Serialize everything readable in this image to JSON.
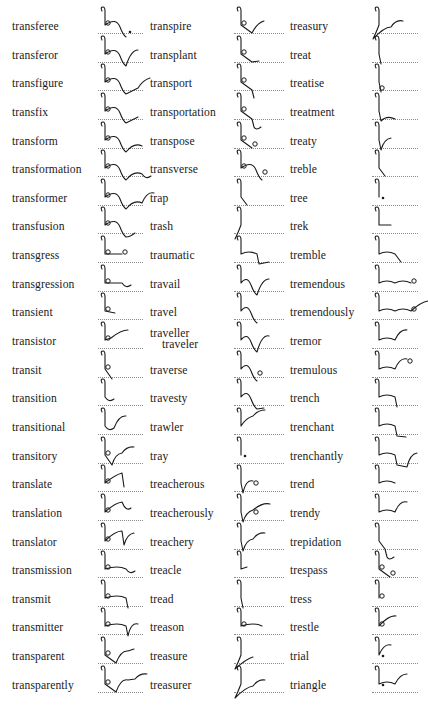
{
  "page": {
    "type": "shorthand-dictionary-page",
    "columns": [
      {
        "entries": [
          {
            "word": "transferee",
            "outline": "tr-ns-f-ee"
          },
          {
            "word": "transferor",
            "outline": "tr-ns-f-r"
          },
          {
            "word": "transfigure",
            "outline": "tr-ns-f-g-r"
          },
          {
            "word": "transfix",
            "outline": "tr-ns-f-x"
          },
          {
            "word": "transform",
            "outline": "tr-ns-f-m"
          },
          {
            "word": "transformation",
            "outline": "tr-ns-f-m-shn"
          },
          {
            "word": "transformer",
            "outline": "tr-ns-f-m-r"
          },
          {
            "word": "transfusion",
            "outline": "tr-ns-f-zhn"
          },
          {
            "word": "transgress",
            "outline": "tr-ns-g-s"
          },
          {
            "word": "transgression",
            "outline": "tr-ns-g-shn"
          },
          {
            "word": "transient",
            "outline": "tr-ns-nt"
          },
          {
            "word": "transistor",
            "outline": "tr-ns-st-r"
          },
          {
            "word": "transit",
            "outline": "tr-ns-t"
          },
          {
            "word": "transition",
            "outline": "tr-shn"
          },
          {
            "word": "transitional",
            "outline": "tr-shn-l"
          },
          {
            "word": "transitory",
            "outline": "tr-ns-t-r-y"
          },
          {
            "word": "translate",
            "outline": "tr-ns-l-t"
          },
          {
            "word": "translation",
            "outline": "tr-ns-l-shn"
          },
          {
            "word": "translator",
            "outline": "tr-ns-l-t-r"
          },
          {
            "word": "transmission",
            "outline": "tr-ns-m-shn"
          },
          {
            "word": "transmit",
            "outline": "tr-ns-m-t"
          },
          {
            "word": "transmitter",
            "outline": "tr-ns-m-t-r"
          },
          {
            "word": "transparent",
            "outline": "tr-ns-p-r-nt"
          },
          {
            "word": "transparently",
            "outline": "tr-ns-p-r-nt-l"
          }
        ]
      },
      {
        "entries": [
          {
            "word": "transpire",
            "outline": "tr-ns-p-r"
          },
          {
            "word": "transplant",
            "outline": "tr-ns-pl-nt"
          },
          {
            "word": "transport",
            "outline": "tr-ns-p-t"
          },
          {
            "word": "transportation",
            "outline": "tr-ns-p-t-shn"
          },
          {
            "word": "transpose",
            "outline": "tr-ns-p-z"
          },
          {
            "word": "transverse",
            "outline": "tr-ns-v-s"
          },
          {
            "word": "trap",
            "outline": "tr-p"
          },
          {
            "word": "trash",
            "outline": "tr-sh"
          },
          {
            "word": "traumatic",
            "outline": "tr-m-t-k"
          },
          {
            "word": "travail",
            "outline": "tr-v-l"
          },
          {
            "word": "travel",
            "outline": "tr-vl"
          },
          {
            "word": "traveller",
            "alt": "traveler",
            "outline": "tr-vl-r"
          },
          {
            "word": "traverse",
            "outline": "tr-v-s"
          },
          {
            "word": "travesty",
            "outline": "tr-v-st"
          },
          {
            "word": "trawler",
            "outline": "tr-l-r"
          },
          {
            "word": "tray",
            "outline": "tr-ay"
          },
          {
            "word": "treacherous",
            "outline": "tr-ch-r-s"
          },
          {
            "word": "treacherously",
            "outline": "tr-ch-r-s-l"
          },
          {
            "word": "treachery",
            "outline": "tr-ch-r-y"
          },
          {
            "word": "treacle",
            "outline": "tr-kl"
          },
          {
            "word": "tread",
            "outline": "tr-d"
          },
          {
            "word": "treason",
            "outline": "tr-z-n"
          },
          {
            "word": "treasure",
            "outline": "tr-zh-r"
          },
          {
            "word": "treasurer",
            "outline": "tr-zh-r-r"
          }
        ]
      },
      {
        "entries": [
          {
            "word": "treasury",
            "outline": "tr-zh-r-y"
          },
          {
            "word": "treat",
            "outline": "tr-t"
          },
          {
            "word": "treatise",
            "outline": "tr-t-s"
          },
          {
            "word": "treatment",
            "outline": "tr-t-mnt"
          },
          {
            "word": "treaty",
            "outline": "tr-t-y"
          },
          {
            "word": "treble",
            "outline": "tr-bl"
          },
          {
            "word": "tree",
            "outline": "tr-ee"
          },
          {
            "word": "trek",
            "outline": "tr-k"
          },
          {
            "word": "tremble",
            "outline": "tr-m-bl"
          },
          {
            "word": "tremendous",
            "outline": "tr-m-nd-s"
          },
          {
            "word": "tremendously",
            "outline": "tr-m-nd-s-l"
          },
          {
            "word": "tremor",
            "outline": "tr-m-r"
          },
          {
            "word": "tremulous",
            "outline": "tr-m-l-s"
          },
          {
            "word": "trench",
            "outline": "tr-n-ch"
          },
          {
            "word": "trenchant",
            "outline": "tr-n-ch-nt"
          },
          {
            "word": "trenchantly",
            "outline": "tr-n-ch-nt-l"
          },
          {
            "word": "trend",
            "outline": "tr-nd"
          },
          {
            "word": "trendy",
            "outline": "tr-nd-y"
          },
          {
            "word": "trepidation",
            "outline": "tr-p-d-shn"
          },
          {
            "word": "trespass",
            "outline": "tr-s-p-s"
          },
          {
            "word": "tress",
            "outline": "tr-s"
          },
          {
            "word": "trestle",
            "outline": "tr-s-l"
          },
          {
            "word": "trial",
            "outline": "tr-i-l"
          },
          {
            "word": "triangle",
            "outline": "tr-i-ng-l"
          }
        ]
      }
    ]
  },
  "colors": {
    "ink": "#1a1a1a",
    "baseline": "#8a8a8a",
    "paper": "#ffffff"
  }
}
